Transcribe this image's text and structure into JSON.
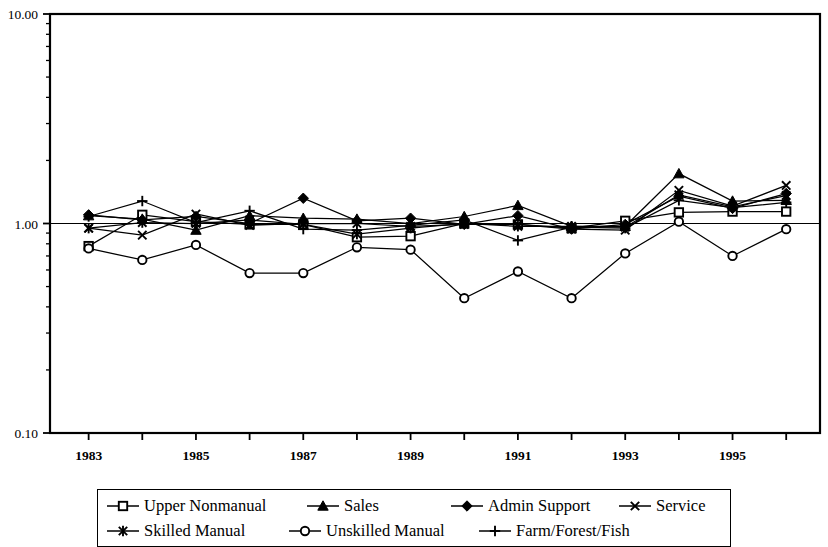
{
  "chart_data": {
    "type": "line",
    "title": "",
    "subtitle": "",
    "xlabel": "",
    "ylabel": "",
    "scale_y": "log",
    "ylim": [
      0.1,
      10.0
    ],
    "y_ticks": [
      {
        "value": 10.0,
        "label": "10.00"
      },
      {
        "value": 1.0,
        "label": "1.00"
      },
      {
        "value": 0.1,
        "label": "0.10"
      }
    ],
    "y_minor_ticks": [
      0.2,
      0.3,
      0.4,
      0.5,
      0.6,
      0.7,
      0.8,
      0.9,
      2,
      3,
      4,
      5,
      6,
      7,
      8,
      9
    ],
    "grid": false,
    "legend_position": "bottom",
    "x": [
      1983,
      1984,
      1985,
      1986,
      1987,
      1988,
      1989,
      1990,
      1991,
      1992,
      1993,
      1994,
      1995,
      1996
    ],
    "x_tick_labels": [
      "1983",
      "",
      "1985",
      "",
      "1987",
      "",
      "1989",
      "",
      "1991",
      "",
      "1993",
      "",
      "1995",
      ""
    ],
    "series": [
      {
        "name": "Upper Nonmanual",
        "marker": "open-square",
        "values": [
          0.78,
          1.1,
          1.02,
          0.99,
          0.99,
          0.86,
          0.87,
          1.0,
          0.99,
          0.95,
          1.03,
          1.13,
          1.14,
          1.14
        ]
      },
      {
        "name": "Sales",
        "marker": "filled-triangle",
        "values": [
          1.09,
          1.05,
          0.93,
          1.09,
          1.06,
          1.05,
          1.0,
          1.08,
          1.22,
          0.97,
          0.97,
          1.73,
          1.28,
          1.29
        ]
      },
      {
        "name": "Admin Support",
        "marker": "filled-diamond",
        "values": [
          1.1,
          1.04,
          1.08,
          1.0,
          1.32,
          1.03,
          1.06,
          0.99,
          1.09,
          0.94,
          0.99,
          1.35,
          1.18,
          1.39
        ]
      },
      {
        "name": "Service",
        "marker": "cross-x",
        "values": [
          0.95,
          0.88,
          1.11,
          0.98,
          1.0,
          1.0,
          0.97,
          0.99,
          0.99,
          0.94,
          0.93,
          1.44,
          1.21,
          1.52
        ]
      },
      {
        "name": "Skilled Manual",
        "marker": "asterisk",
        "values": [
          0.95,
          1.01,
          1.0,
          1.04,
          0.99,
          0.89,
          0.95,
          1.0,
          0.97,
          0.97,
          0.96,
          1.37,
          1.2,
          1.36
        ]
      },
      {
        "name": "Unskilled Manual",
        "marker": "open-circle",
        "values": [
          0.76,
          0.67,
          0.79,
          0.58,
          0.58,
          0.77,
          0.75,
          0.44,
          0.59,
          0.44,
          0.72,
          1.02,
          0.7,
          0.94
        ]
      },
      {
        "name": "Farm/Forest/Fish",
        "marker": "plus",
        "values": [
          1.08,
          1.28,
          1.01,
          1.15,
          0.94,
          0.93,
          0.98,
          1.04,
          0.83,
          0.96,
          0.95,
          1.29,
          1.19,
          1.26
        ]
      }
    ]
  },
  "legend": {
    "items": [
      {
        "label": "Upper Nonmanual",
        "marker": "open-square"
      },
      {
        "label": "Sales",
        "marker": "filled-triangle"
      },
      {
        "label": "Admin Support",
        "marker": "filled-diamond"
      },
      {
        "label": "Service",
        "marker": "cross-x"
      },
      {
        "label": "Skilled Manual",
        "marker": "asterisk"
      },
      {
        "label": "Unskilled Manual",
        "marker": "open-circle"
      },
      {
        "label": "Farm/Forest/Fish",
        "marker": "plus"
      }
    ]
  },
  "colors": {
    "line": "#000000",
    "axis": "#000000",
    "background": "#ffffff"
  }
}
